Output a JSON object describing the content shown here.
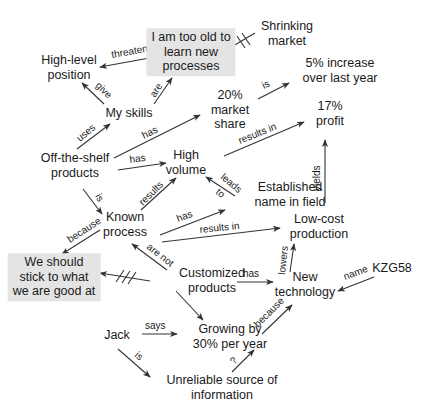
{
  "nodes": {
    "too_old": "I am too old to\nlearn new\nprocesses",
    "shrinking": "Shrinking\nmarket",
    "high_level": "High-level\nposition",
    "increase": "5% increase\nover last year",
    "my_skills": "My skills",
    "market_share": "20%\nmarket\nshare",
    "profit": "17%\nprofit",
    "off_shelf": "Off-the-shelf\nproducts",
    "high_volume": "High\nvolume",
    "established": "Established\nname in field",
    "known": "Known\nprocess",
    "low_cost": "Low-cost\nproduction",
    "stick": "We should\nstick to what\nwe are good at",
    "customized": "Customized\nproducts",
    "new_tech": "New\ntechnology",
    "kzg": "KZG58",
    "jack": "Jack",
    "growing": "Growing by\n30% per year",
    "unreliable": "Unreliable source of\ninformation"
  },
  "edges": {
    "threatens": "threatens",
    "give": "give",
    "are": "are",
    "uses": "uses",
    "has_share": "has",
    "is_increase": "is",
    "results_in_profit": "results in",
    "has_volume": "has",
    "is_known": "is",
    "results": "results",
    "leads_to": "leads\nto",
    "yields": "yields",
    "has_established": "has",
    "results_in_lowcost": "results in",
    "because_stick": "because",
    "are_not": "are not",
    "has_newtech": "has",
    "lowers": "lowers",
    "name": "name",
    "says": "says",
    "because_growing": "because",
    "is_unreliable": "is",
    "question": "?"
  }
}
